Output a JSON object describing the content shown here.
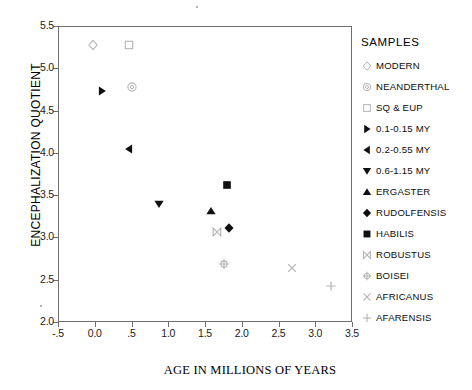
{
  "chart_data": {
    "type": "scatter",
    "title": "",
    "xlabel": "AGE IN MILLIONS OF YEARS",
    "ylabel": "ENCEPHALIZATION QUOTIENT",
    "xlim": [
      -0.5,
      3.5
    ],
    "ylim": [
      2.0,
      5.5
    ],
    "grid": false,
    "legend_position": "right",
    "xticks": [
      "-.5",
      "0.0",
      ".5",
      "1.0",
      "1.5",
      "2.0",
      "2.5",
      "3.0",
      "3.5"
    ],
    "xtick_values": [
      -0.5,
      0.0,
      0.5,
      1.0,
      1.5,
      2.0,
      2.5,
      3.0,
      3.5
    ],
    "yticks": [
      "2.0",
      "2.5",
      "3.0",
      "3.5",
      "4.0",
      "4.5",
      "5.0",
      "5.5"
    ],
    "ytick_values": [
      2.0,
      2.5,
      3.0,
      3.5,
      4.0,
      4.5,
      5.0,
      5.5
    ],
    "series": [
      {
        "name": "MODERN",
        "marker": "open-diamond",
        "x": [
          -0.03
        ],
        "y": [
          5.28
        ]
      },
      {
        "name": "NEANDERTHAL",
        "marker": "circled-dot",
        "x": [
          0.5
        ],
        "y": [
          4.78
        ]
      },
      {
        "name": "SQ & EUP",
        "marker": "open-square",
        "x": [
          0.46
        ],
        "y": [
          5.28
        ]
      },
      {
        "name": "0.1-0.15 MY",
        "marker": "right-triangle",
        "x": [
          0.1
        ],
        "y": [
          4.73
        ]
      },
      {
        "name": "0.2-0.55 MY",
        "marker": "left-triangle",
        "x": [
          0.46
        ],
        "y": [
          4.05
        ]
      },
      {
        "name": "0.6-1.15 MY",
        "marker": "down-triangle",
        "x": [
          0.88
        ],
        "y": [
          3.4
        ]
      },
      {
        "name": "ERGASTER",
        "marker": "up-triangle",
        "x": [
          1.58
        ],
        "y": [
          3.31
        ]
      },
      {
        "name": "RUDOLFENSIS",
        "marker": "filled-diamond",
        "x": [
          1.82
        ],
        "y": [
          3.11
        ]
      },
      {
        "name": "HABILIS",
        "marker": "filled-square",
        "x": [
          1.8
        ],
        "y": [
          3.62
        ]
      },
      {
        "name": "ROBUSTUS",
        "marker": "bowtie",
        "x": [
          1.66
        ],
        "y": [
          3.07
        ]
      },
      {
        "name": "BOISEI",
        "marker": "circled-plus",
        "x": [
          1.76
        ],
        "y": [
          2.69
        ]
      },
      {
        "name": "AFRICANUS",
        "marker": "x-cross",
        "x": [
          2.68
        ],
        "y": [
          2.64
        ]
      },
      {
        "name": "AFARENSIS",
        "marker": "plus-cross",
        "x": [
          3.21
        ],
        "y": [
          2.43
        ]
      }
    ]
  },
  "legend": {
    "title": "SAMPLES",
    "items": [
      {
        "label": "MODERN",
        "marker": "open-diamond"
      },
      {
        "label": "NEANDERTHAL",
        "marker": "circled-dot"
      },
      {
        "label": "SQ & EUP",
        "marker": "open-square"
      },
      {
        "label": "0.1-0.15 MY",
        "marker": "right-triangle"
      },
      {
        "label": "0.2-0.55 MY",
        "marker": "left-triangle"
      },
      {
        "label": "0.6-1.15 MY",
        "marker": "down-triangle"
      },
      {
        "label": "ERGASTER",
        "marker": "up-triangle"
      },
      {
        "label": "RUDOLFENSIS",
        "marker": "filled-diamond"
      },
      {
        "label": "HABILIS",
        "marker": "filled-square"
      },
      {
        "label": "ROBUSTUS",
        "marker": "bowtie"
      },
      {
        "label": "BOISEI",
        "marker": "circled-plus"
      },
      {
        "label": "AFRICANUS",
        "marker": "x-cross"
      },
      {
        "label": "AFARENSIS",
        "marker": "plus-cross"
      }
    ]
  },
  "colors": {
    "marker_fill": "#101010",
    "marker_open": "#b4b4b4",
    "axis": "#6e6e6e",
    "text": "#111111",
    "background": "#ffffff"
  }
}
